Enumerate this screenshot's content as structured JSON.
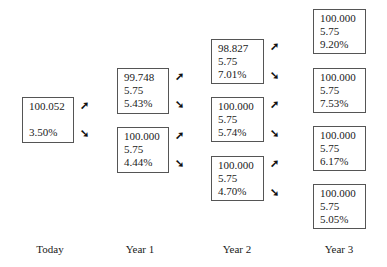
{
  "diagram": {
    "type": "binomial-interest-rate-tree",
    "columns": [
      {
        "label": "Today",
        "nodes": [
          {
            "value": "100.052",
            "coupon": "",
            "rate": "3.50%"
          }
        ]
      },
      {
        "label": "Year 1",
        "nodes": [
          {
            "value": "99.748",
            "coupon": "5.75",
            "rate": "5.43%"
          },
          {
            "value": "100.000",
            "coupon": "5.75",
            "rate": "4.44%"
          }
        ]
      },
      {
        "label": "Year 2",
        "nodes": [
          {
            "value": "98.827",
            "coupon": "5.75",
            "rate": "7.01%"
          },
          {
            "value": "100.000",
            "coupon": "5.75",
            "rate": "5.74%"
          },
          {
            "value": "100.000",
            "coupon": "5.75",
            "rate": "4.70%"
          }
        ]
      },
      {
        "label": "Year 3",
        "nodes": [
          {
            "value": "100.000",
            "coupon": "5.75",
            "rate": "9.20%"
          },
          {
            "value": "100.000",
            "coupon": "5.75",
            "rate": "7.53%"
          },
          {
            "value": "100.000",
            "coupon": "5.75",
            "rate": "6.17%"
          },
          {
            "value": "100.000",
            "coupon": "5.75",
            "rate": "5.05%"
          }
        ]
      }
    ],
    "arrows": {
      "up": "➚",
      "down": "➘"
    }
  }
}
